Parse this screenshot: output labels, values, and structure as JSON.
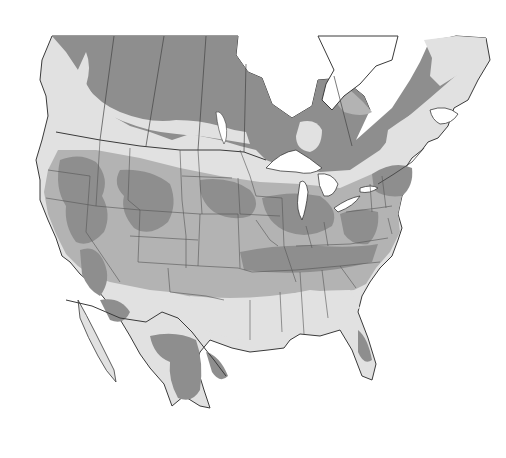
{
  "map": {
    "type": "grayscale zone map",
    "region": "North America (southern Canada, United States, northern Mexico)",
    "labels": [],
    "shades": {
      "dark": "#8e8e8e",
      "mid": "#b3b3b3",
      "light": "#e1e1e1",
      "water": "#ffffff",
      "border": "#3a3a3a",
      "state_border": "#555555"
    },
    "legend": null
  }
}
